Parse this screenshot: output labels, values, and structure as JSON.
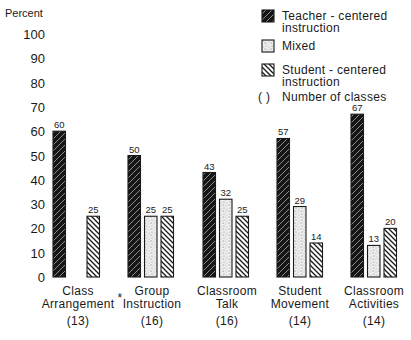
{
  "chart_data": {
    "type": "bar",
    "title": "",
    "ylabel": "Percent",
    "xlabel": "",
    "ylim": [
      0,
      100
    ],
    "yticks": [
      0,
      10,
      20,
      30,
      40,
      50,
      60,
      70,
      80,
      90,
      100
    ],
    "grid": false,
    "legend_position": "top-right",
    "categories": [
      {
        "lines": [
          "Class",
          "Arrangement"
        ],
        "note": "*",
        "count": "(13)"
      },
      {
        "lines": [
          "Group",
          "Instruction"
        ],
        "note": "",
        "count": "(16)"
      },
      {
        "lines": [
          "Classroom",
          "Talk"
        ],
        "note": "",
        "count": "(16)"
      },
      {
        "lines": [
          "Student",
          "Movement"
        ],
        "note": "",
        "count": "(14)"
      },
      {
        "lines": [
          "Classroom",
          "Activities"
        ],
        "note": "",
        "count": "(14)"
      }
    ],
    "series": [
      {
        "name": "Teacher-centered instruction",
        "legend_lines": [
          "Teacher - centered",
          "instruction"
        ],
        "pattern": "dark-hatch",
        "values": [
          60,
          50,
          43,
          57,
          67
        ]
      },
      {
        "name": "Mixed",
        "legend_lines": [
          "Mixed"
        ],
        "pattern": "stipple",
        "values": [
          null,
          25,
          32,
          29,
          13
        ]
      },
      {
        "name": "Student-centered instruction",
        "legend_lines": [
          "Student - centered",
          "instruction"
        ],
        "pattern": "light-hatch",
        "values": [
          25,
          25,
          25,
          14,
          20
        ]
      }
    ],
    "legend_note": {
      "symbol": "( )",
      "label": "Number of classes"
    }
  }
}
